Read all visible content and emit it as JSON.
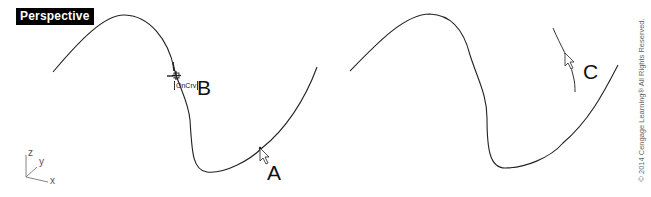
{
  "viewport": {
    "title": "Perspective"
  },
  "annotations": {
    "label_a": "A",
    "label_b": "B",
    "label_c": "C",
    "osnap_tooltip": "OnCrv"
  },
  "axes": {
    "x": "x",
    "y": "y",
    "z": "z"
  },
  "copyright": "© 2014 Cengage Learning® All Rights Reserved.",
  "colors": {
    "curve": "#222222",
    "label_bg": "#000000",
    "label_fg": "#ffffff"
  }
}
